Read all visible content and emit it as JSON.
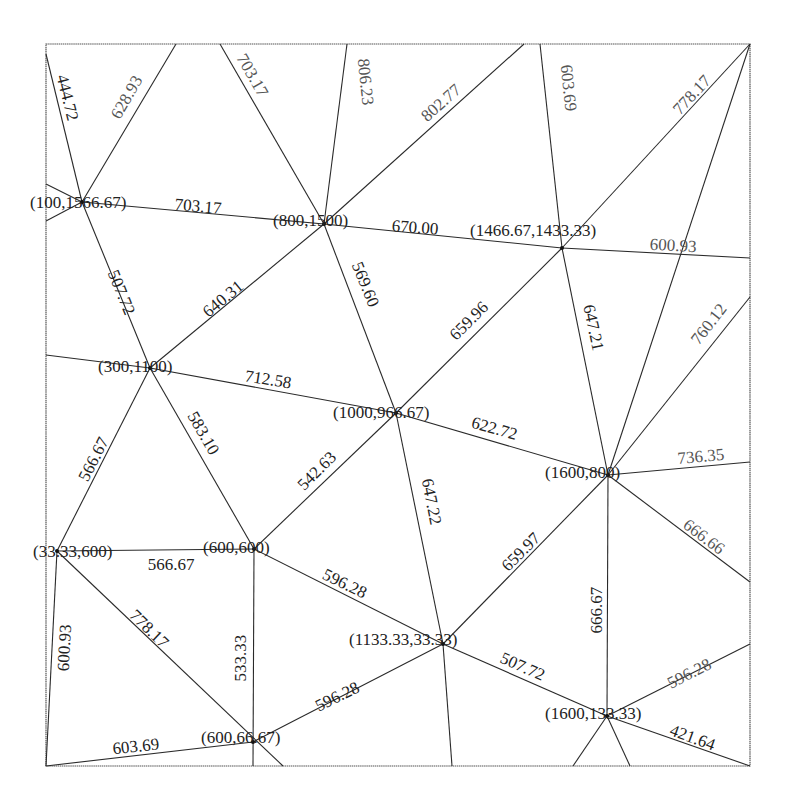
{
  "diagram": {
    "frame": {
      "x": 46,
      "y": 44,
      "width": 704,
      "height": 722,
      "stroke": "#555555"
    },
    "nodes": [
      {
        "id": "A",
        "label": "(100,1566.67)",
        "px": 82,
        "py": 202,
        "lx": 30,
        "ly": 208
      },
      {
        "id": "B",
        "label": "(800,1500)",
        "px": 324,
        "py": 224,
        "lx": 273,
        "ly": 226
      },
      {
        "id": "C",
        "label": "(1466.67,1433.33)",
        "px": 562,
        "py": 248,
        "lx": 470,
        "ly": 236
      },
      {
        "id": "D",
        "label": "(300,1100)",
        "px": 150,
        "py": 368,
        "lx": 98,
        "ly": 372
      },
      {
        "id": "E",
        "label": "(1000,966.67)",
        "px": 396,
        "py": 413,
        "lx": 333,
        "ly": 418
      },
      {
        "id": "F",
        "label": "(1600,800)",
        "px": 608,
        "py": 475,
        "lx": 545,
        "ly": 478
      },
      {
        "id": "G",
        "label": "(33.33,600)",
        "px": 57,
        "py": 551,
        "lx": 33,
        "ly": 557
      },
      {
        "id": "H",
        "label": "(600,600)",
        "px": 254,
        "py": 549,
        "lx": 203,
        "ly": 553
      },
      {
        "id": "I",
        "label": "(1133.33,33.33)",
        "px": 443,
        "py": 644,
        "lx": 349,
        "ly": 645
      },
      {
        "id": "J",
        "label": "(1600,133.33)",
        "px": 607,
        "py": 716,
        "lx": 545,
        "ly": 719
      },
      {
        "id": "K",
        "label": "(600,66.67)",
        "px": 253,
        "py": 742,
        "lx": 201,
        "ly": 743
      }
    ],
    "edges": [
      {
        "from": [
          82,
          202
        ],
        "to": [
          46,
          54
        ],
        "label": "444.72",
        "lx": 66,
        "ly": 98,
        "angle": 76,
        "tone": "dark"
      },
      {
        "from": [
          82,
          202
        ],
        "to": [
          176,
          44
        ],
        "label": "628.93",
        "lx": 128,
        "ly": 98,
        "angle": -60,
        "tone": "gray"
      },
      {
        "from": [
          82,
          202
        ],
        "to": [
          46,
          184
        ],
        "label": "",
        "lx": 0,
        "ly": 0,
        "angle": 0,
        "tone": "dark"
      },
      {
        "from": [
          82,
          202
        ],
        "to": [
          46,
          221
        ],
        "label": "",
        "lx": 0,
        "ly": 0,
        "angle": 0,
        "tone": "dark"
      },
      {
        "from": [
          82,
          202
        ],
        "to": [
          324,
          224
        ],
        "label": "703.17",
        "lx": 198,
        "ly": 208,
        "angle": 5,
        "tone": "dark"
      },
      {
        "from": [
          82,
          202
        ],
        "to": [
          150,
          368
        ],
        "label": "507.72",
        "lx": 120,
        "ly": 293,
        "angle": 68,
        "tone": "dark"
      },
      {
        "from": [
          324,
          224
        ],
        "to": [
          220,
          44
        ],
        "label": "703.17",
        "lx": 251,
        "ly": 76,
        "angle": 60,
        "tone": "gray"
      },
      {
        "from": [
          324,
          224
        ],
        "to": [
          347,
          44
        ],
        "label": "806.23",
        "lx": 364,
        "ly": 82,
        "angle": 84,
        "tone": "gray"
      },
      {
        "from": [
          324,
          224
        ],
        "to": [
          524,
          44
        ],
        "label": "802.77",
        "lx": 442,
        "ly": 104,
        "angle": -42,
        "tone": "gray"
      },
      {
        "from": [
          324,
          224
        ],
        "to": [
          562,
          248
        ],
        "label": "670.00",
        "lx": 415,
        "ly": 229,
        "angle": 4,
        "tone": "dark"
      },
      {
        "from": [
          324,
          224
        ],
        "to": [
          150,
          368
        ],
        "label": "640.31",
        "lx": 224,
        "ly": 300,
        "angle": -40,
        "tone": "dark"
      },
      {
        "from": [
          324,
          224
        ],
        "to": [
          396,
          413
        ],
        "label": "569.60",
        "lx": 364,
        "ly": 285,
        "angle": 68,
        "tone": "dark"
      },
      {
        "from": [
          562,
          248
        ],
        "to": [
          540,
          44
        ],
        "label": "603.69",
        "lx": 567,
        "ly": 88,
        "angle": 84,
        "tone": "gray"
      },
      {
        "from": [
          562,
          248
        ],
        "to": [
          750,
          44
        ],
        "label": "778.17",
        "lx": 693,
        "ly": 96,
        "angle": -47,
        "tone": "gray"
      },
      {
        "from": [
          562,
          248
        ],
        "to": [
          750,
          258
        ],
        "label": "600.93",
        "lx": 673,
        "ly": 247,
        "angle": 3,
        "tone": "gray"
      },
      {
        "from": [
          562,
          248
        ],
        "to": [
          396,
          413
        ],
        "label": "659.96",
        "lx": 470,
        "ly": 322,
        "angle": -45,
        "tone": "dark"
      },
      {
        "from": [
          562,
          248
        ],
        "to": [
          608,
          475
        ],
        "label": "647.21",
        "lx": 592,
        "ly": 328,
        "angle": 78,
        "tone": "dark"
      },
      {
        "from": [
          150,
          368
        ],
        "to": [
          46,
          355
        ],
        "label": "",
        "lx": 0,
        "ly": 0,
        "angle": 0,
        "tone": "dark"
      },
      {
        "from": [
          150,
          368
        ],
        "to": [
          396,
          413
        ],
        "label": "712.58",
        "lx": 268,
        "ly": 381,
        "angle": 9,
        "tone": "dark"
      },
      {
        "from": [
          150,
          368
        ],
        "to": [
          57,
          551
        ],
        "label": "566.67",
        "lx": 95,
        "ly": 460,
        "angle": -63,
        "tone": "dark"
      },
      {
        "from": [
          150,
          368
        ],
        "to": [
          254,
          549
        ],
        "label": "583.10",
        "lx": 202,
        "ly": 434,
        "angle": 60,
        "tone": "dark"
      },
      {
        "from": [
          396,
          413
        ],
        "to": [
          254,
          549
        ],
        "label": "542.63",
        "lx": 318,
        "ly": 472,
        "angle": -45,
        "tone": "dark"
      },
      {
        "from": [
          396,
          413
        ],
        "to": [
          608,
          475
        ],
        "label": "622.72",
        "lx": 494,
        "ly": 430,
        "angle": 16,
        "tone": "dark"
      },
      {
        "from": [
          396,
          413
        ],
        "to": [
          443,
          644
        ],
        "label": "647.22",
        "lx": 430,
        "ly": 502,
        "angle": 79,
        "tone": "dark"
      },
      {
        "from": [
          608,
          475
        ],
        "to": [
          750,
          44
        ],
        "label": "",
        "lx": 0,
        "ly": 0,
        "angle": 0,
        "tone": "dark"
      },
      {
        "from": [
          608,
          475
        ],
        "to": [
          750,
          297
        ],
        "label": "760.12",
        "lx": 710,
        "ly": 325,
        "angle": -52,
        "tone": "gray"
      },
      {
        "from": [
          608,
          475
        ],
        "to": [
          750,
          462
        ],
        "label": "736.35",
        "lx": 701,
        "ly": 458,
        "angle": -5,
        "tone": "gray"
      },
      {
        "from": [
          608,
          475
        ],
        "to": [
          750,
          582
        ],
        "label": "666.66",
        "lx": 703,
        "ly": 538,
        "angle": 37,
        "tone": "gray"
      },
      {
        "from": [
          608,
          475
        ],
        "to": [
          443,
          644
        ],
        "label": "659.97",
        "lx": 522,
        "ly": 553,
        "angle": -45,
        "tone": "dark"
      },
      {
        "from": [
          608,
          475
        ],
        "to": [
          607,
          716
        ],
        "label": "666.67",
        "lx": 598,
        "ly": 610,
        "angle": -90,
        "tone": "dark"
      },
      {
        "from": [
          57,
          551
        ],
        "to": [
          254,
          549
        ],
        "label": "566.67",
        "lx": 171,
        "ly": 566,
        "angle": 0,
        "tone": "dark"
      },
      {
        "from": [
          57,
          551
        ],
        "to": [
          46,
          766
        ],
        "label": "600.93",
        "lx": 66,
        "ly": 648,
        "angle": -87,
        "tone": "dark"
      },
      {
        "from": [
          57,
          551
        ],
        "to": [
          283,
          766
        ],
        "label": "778.17",
        "lx": 148,
        "ly": 630,
        "angle": 44,
        "tone": "dark"
      },
      {
        "from": [
          254,
          549
        ],
        "to": [
          253,
          766
        ],
        "label": "533.33",
        "lx": 242,
        "ly": 658,
        "angle": -90,
        "tone": "dark"
      },
      {
        "from": [
          254,
          549
        ],
        "to": [
          443,
          644
        ],
        "label": "596.28",
        "lx": 344,
        "ly": 585,
        "angle": 26,
        "tone": "dark"
      },
      {
        "from": [
          253,
          742
        ],
        "to": [
          46,
          766
        ],
        "label": "603.69",
        "lx": 136,
        "ly": 748,
        "angle": -6,
        "tone": "dark"
      },
      {
        "from": [
          253,
          742
        ],
        "to": [
          443,
          644
        ],
        "label": "596.28",
        "lx": 338,
        "ly": 698,
        "angle": -26,
        "tone": "dark"
      },
      {
        "from": [
          443,
          644
        ],
        "to": [
          452,
          766
        ],
        "label": "",
        "lx": 0,
        "ly": 0,
        "angle": 0,
        "tone": "dark"
      },
      {
        "from": [
          443,
          644
        ],
        "to": [
          607,
          716
        ],
        "label": "507.72",
        "lx": 522,
        "ly": 668,
        "angle": 24,
        "tone": "dark"
      },
      {
        "from": [
          607,
          716
        ],
        "to": [
          750,
          644
        ],
        "label": "596.28",
        "lx": 690,
        "ly": 675,
        "angle": -27,
        "tone": "gray"
      },
      {
        "from": [
          607,
          716
        ],
        "to": [
          750,
          766
        ],
        "label": "421.64",
        "lx": 692,
        "ly": 739,
        "angle": 20,
        "tone": "dark"
      },
      {
        "from": [
          607,
          716
        ],
        "to": [
          573,
          766
        ],
        "label": "",
        "lx": 0,
        "ly": 0,
        "angle": 0,
        "tone": "dark"
      },
      {
        "from": [
          607,
          716
        ],
        "to": [
          630,
          766
        ],
        "label": "",
        "lx": 0,
        "ly": 0,
        "angle": 0,
        "tone": "dark"
      }
    ]
  }
}
